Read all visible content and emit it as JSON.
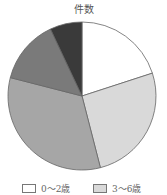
{
  "chart_data": {
    "type": "pie",
    "title": "件数",
    "categories": [
      "0～2歳",
      "3～6歳",
      "7～12歳",
      "13～15歳",
      "16～18歳"
    ],
    "values": [
      20,
      26,
      33,
      14,
      7
    ],
    "colors": [
      "#ffffff",
      "#d9d9d9",
      "#a6a6a6",
      "#7a7a7a",
      "#3a3a3a"
    ],
    "legend_visible": [
      "0～2歳",
      "3～6歳"
    ],
    "start_angle": "top, clockwise"
  },
  "legend": {
    "items": [
      {
        "label": "0～2歳",
        "color": "#ffffff"
      },
      {
        "label": "3～6歳",
        "color": "#d9d9d9"
      }
    ]
  }
}
